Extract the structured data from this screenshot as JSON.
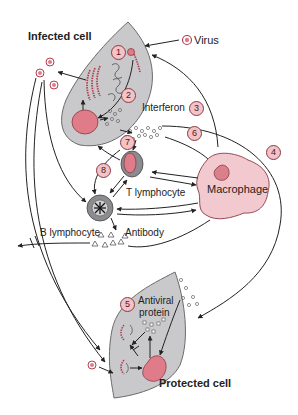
{
  "figure": {
    "title_infected": "Infected cell",
    "title_protected": "Protected cell",
    "labels": {
      "virus": "Virus",
      "interferon": "Interferon",
      "macrophage": "Macrophage",
      "t_lymphocyte": "T lymphocyte",
      "b_lymphocyte": "B lymphocyte",
      "antibody": "Antibody",
      "antiviral_line1": "Antiviral",
      "antiviral_line2": "protein"
    },
    "steps": [
      "1",
      "2",
      "3",
      "4",
      "5",
      "6",
      "7",
      "8"
    ],
    "colors": {
      "cell_fill": "#c9c9cb",
      "cell_stroke": "#6b6b6b",
      "nucleus": "#e07c8a",
      "macrophage_fill": "#f2c9cf",
      "macrophage_nucleus": "#d9808c",
      "step_circle": "#f3c3c8",
      "arrow": "#222222"
    }
  }
}
